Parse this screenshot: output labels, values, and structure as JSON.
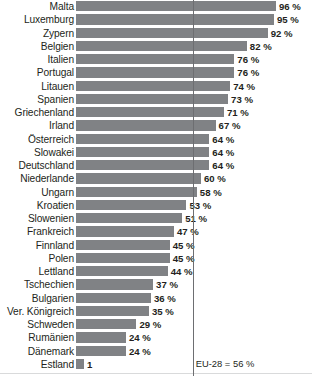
{
  "chart_data": {
    "type": "bar",
    "orientation": "horizontal",
    "title": "",
    "subtitle": "",
    "xlabel": "",
    "ylabel": "",
    "xlim": [
      0,
      96
    ],
    "grid": false,
    "legend": "none",
    "value_suffix": "%",
    "categories": [
      "Malta",
      "Luxemburg",
      "Zypern",
      "Belgien",
      "Italien",
      "Portugal",
      "Litauen",
      "Spanien",
      "Griechenland",
      "Irland",
      "Österreich",
      "Slowakei",
      "Deutschland",
      "Niederlande",
      "Ungarn",
      "Kroatien",
      "Slowenien",
      "Frankreich",
      "Finnland",
      "Polen",
      "Lettland",
      "Tschechien",
      "Bulgarien",
      "Ver. Königreich",
      "Schweden",
      "Rumänien",
      "Dänemark",
      "Estland"
    ],
    "values": [
      96,
      95,
      92,
      82,
      76,
      76,
      74,
      73,
      71,
      67,
      64,
      64,
      64,
      60,
      58,
      53,
      51,
      47,
      45,
      45,
      44,
      37,
      36,
      35,
      29,
      24,
      24,
      1
    ],
    "value_labels": [
      "96 %",
      "95 %",
      "92 %",
      "82 %",
      "76 %",
      "76 %",
      "74 %",
      "73 %",
      "71 %",
      "67 %",
      "64 %",
      "64 %",
      "64 %",
      "60 %",
      "58 %",
      "53 %",
      "51 %",
      "47 %",
      "45 %",
      "45 %",
      "44 %",
      "37 %",
      "36 %",
      "35 %",
      "29 %",
      "24 %",
      "24 %",
      "1"
    ],
    "reference_line": {
      "label": "EU-28 = 56 %",
      "value": 56
    },
    "colors": {
      "bar": "#808285",
      "reference_line": "#6d6e71",
      "text": "#231f20"
    }
  }
}
